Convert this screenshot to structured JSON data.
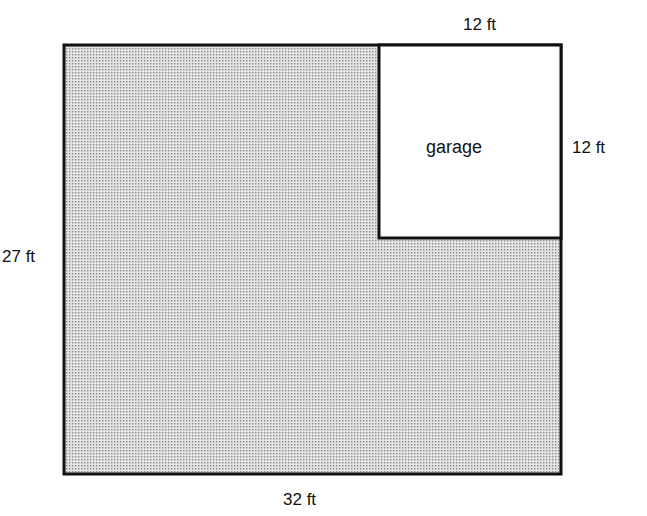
{
  "diagram": {
    "type": "floor-plan",
    "shapes": {
      "house": {
        "width": 32,
        "height": 27,
        "unit": "ft",
        "fill": "stippled gray"
      },
      "garage": {
        "width": 12,
        "height": 12,
        "unit": "ft",
        "fill": "#ffffff"
      }
    },
    "labels": {
      "garage_width": "12 ft",
      "garage_height": "12 ft",
      "garage_name": "garage",
      "house_height": "27 ft",
      "house_width": "32 ft"
    }
  }
}
